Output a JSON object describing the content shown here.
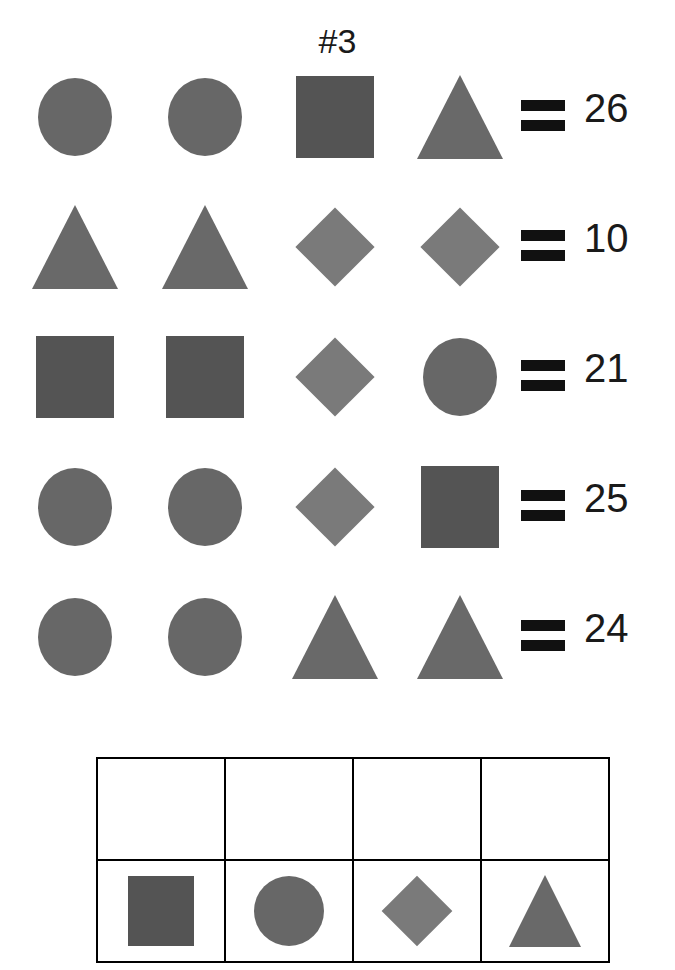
{
  "title": "#3",
  "shape_colors": {
    "circle": "#676767",
    "square": "#545454",
    "triangle": "#696969",
    "diamond": "#7a7a7a"
  },
  "equations": [
    {
      "shapes": [
        "circle",
        "circle",
        "square",
        "triangle"
      ],
      "equals": "=",
      "total": "26"
    },
    {
      "shapes": [
        "triangle",
        "triangle",
        "diamond",
        "diamond"
      ],
      "equals": "=",
      "total": "10"
    },
    {
      "shapes": [
        "square",
        "square",
        "diamond",
        "circle"
      ],
      "equals": "=",
      "total": "21"
    },
    {
      "shapes": [
        "circle",
        "circle",
        "diamond",
        "square"
      ],
      "equals": "=",
      "total": "25"
    },
    {
      "shapes": [
        "circle",
        "circle",
        "triangle",
        "triangle"
      ],
      "equals": "=",
      "total": "24"
    }
  ],
  "answer_table": {
    "answer_row": [
      "",
      "",
      "",
      ""
    ],
    "legend_row": [
      "square",
      "circle",
      "diamond",
      "triangle"
    ]
  }
}
